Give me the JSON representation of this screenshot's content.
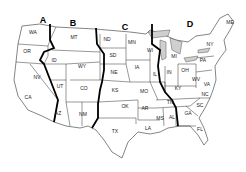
{
  "map": {
    "title": "United States zone map",
    "zones": [
      {
        "id": "A",
        "label": "A",
        "x": 43,
        "y": 23
      },
      {
        "id": "B",
        "label": "B",
        "x": 73,
        "y": 26
      },
      {
        "id": "C",
        "label": "C",
        "x": 125,
        "y": 30
      },
      {
        "id": "D",
        "label": "D",
        "x": 190,
        "y": 27
      }
    ],
    "states": [
      {
        "code": "WA",
        "x": 33,
        "y": 34
      },
      {
        "code": "OR",
        "x": 27,
        "y": 53
      },
      {
        "code": "CA",
        "x": 28,
        "y": 99
      },
      {
        "code": "NV",
        "x": 37,
        "y": 79
      },
      {
        "code": "ID",
        "x": 54,
        "y": 62
      },
      {
        "code": "MT",
        "x": 74,
        "y": 39
      },
      {
        "code": "WY",
        "x": 82,
        "y": 68
      },
      {
        "code": "UT",
        "x": 60,
        "y": 88
      },
      {
        "code": "CO",
        "x": 84,
        "y": 90
      },
      {
        "code": "AZ",
        "x": 58,
        "y": 115
      },
      {
        "code": "NM",
        "x": 83,
        "y": 116
      },
      {
        "code": "ND",
        "x": 107,
        "y": 41
      },
      {
        "code": "SD",
        "x": 113,
        "y": 57
      },
      {
        "code": "NE",
        "x": 114,
        "y": 74
      },
      {
        "code": "KS",
        "x": 115,
        "y": 92
      },
      {
        "code": "OK",
        "x": 125,
        "y": 108
      },
      {
        "code": "TX",
        "x": 115,
        "y": 133
      },
      {
        "code": "MN",
        "x": 132,
        "y": 44
      },
      {
        "code": "IA",
        "x": 137,
        "y": 69
      },
      {
        "code": "MO",
        "x": 144,
        "y": 93
      },
      {
        "code": "AR",
        "x": 145,
        "y": 110
      },
      {
        "code": "LA",
        "x": 148,
        "y": 130
      },
      {
        "code": "WI",
        "x": 150,
        "y": 52
      },
      {
        "code": "IL",
        "x": 155,
        "y": 76
      },
      {
        "code": "MS",
        "x": 160,
        "y": 120
      },
      {
        "code": "AL",
        "x": 172,
        "y": 119
      },
      {
        "code": "TN",
        "x": 170,
        "y": 104
      },
      {
        "code": "MI",
        "x": 174,
        "y": 58
      },
      {
        "code": "IN",
        "x": 169,
        "y": 74
      },
      {
        "code": "KY",
        "x": 178,
        "y": 90
      },
      {
        "code": "OH",
        "x": 185,
        "y": 72
      },
      {
        "code": "WV",
        "x": 196,
        "y": 81
      },
      {
        "code": "VA",
        "x": 207,
        "y": 86
      },
      {
        "code": "NC",
        "x": 205,
        "y": 96
      },
      {
        "code": "SC",
        "x": 200,
        "y": 107
      },
      {
        "code": "GA",
        "x": 188,
        "y": 115
      },
      {
        "code": "FL",
        "x": 200,
        "y": 131
      },
      {
        "code": "PA",
        "x": 203,
        "y": 62
      },
      {
        "code": "NY",
        "x": 210,
        "y": 46
      },
      {
        "code": "ME",
        "x": 230,
        "y": 24
      }
    ]
  }
}
